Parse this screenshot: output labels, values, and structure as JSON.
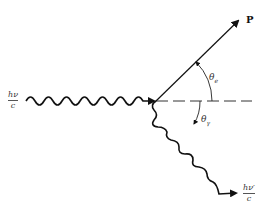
{
  "diagram": {
    "incident_photon": {
      "numerator": "hν",
      "denominator": "c"
    },
    "scattered_photon": {
      "numerator": "hν′",
      "denominator": "c"
    },
    "electron_momentum": {
      "label": "P"
    },
    "electron_angle": {
      "symbol": "θ",
      "subscript": "e"
    },
    "photon_angle": {
      "symbol": "θ",
      "subscript": "γ"
    },
    "colors": {
      "line": "#111111",
      "background": "#ffffff"
    }
  }
}
